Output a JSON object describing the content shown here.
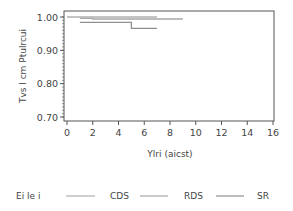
{
  "chart_data": {
    "type": "line",
    "subtype": "step (Kaplan-Meier)",
    "title": "",
    "xlabel": "Ylri (aicst)",
    "ylabel": "Tvs l cm Ptulrcui",
    "xlim": [
      0,
      16
    ],
    "ylim": [
      0.7,
      1.0
    ],
    "x_ticks": [
      "0",
      "2",
      "4",
      "6",
      "8",
      "10",
      "12",
      "14",
      "16"
    ],
    "y_ticks": [
      "0.70",
      "0.80",
      "0.90",
      "1.00"
    ],
    "grid": false,
    "legend_position": "bottom",
    "legend_title": "Ei le i",
    "series": [
      {
        "name": "CDS",
        "color": "#b0b0b0",
        "points": [
          [
            0,
            1.0
          ],
          [
            7,
            1.0
          ]
        ]
      },
      {
        "name": "RDS",
        "color": "#a8a8a8",
        "points": [
          [
            1,
            0.996
          ],
          [
            2,
            0.996
          ],
          [
            2,
            0.994
          ],
          [
            9,
            0.994
          ]
        ]
      },
      {
        "name": "SR",
        "color": "#909090",
        "points": [
          [
            1,
            0.984
          ],
          [
            5,
            0.984
          ],
          [
            5,
            0.966
          ],
          [
            7,
            0.966
          ]
        ]
      }
    ]
  },
  "legend": {
    "title": "Ei le i",
    "items": [
      {
        "label": "CDS"
      },
      {
        "label": "RDS"
      },
      {
        "label": "SR"
      }
    ]
  }
}
